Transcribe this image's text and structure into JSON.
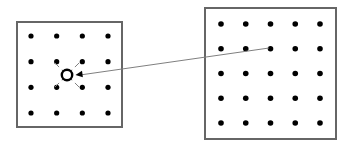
{
  "figure": {
    "background_color": "#ffffff",
    "width": 346,
    "height": 149,
    "panels": [
      {
        "id": "left-panel",
        "name": "coarse-lattice-panel",
        "border_color": "#666666",
        "border_width": 2,
        "fill_color": "#ffffff",
        "x": 17,
        "y": 22,
        "width": 105,
        "height": 105,
        "grid": {
          "rows": 4,
          "cols": 4,
          "dot_color": "#000000",
          "dot_radius": 2.6,
          "margin_x": 14,
          "margin_y": 14
        },
        "highlight": {
          "name": "center-ring-marker",
          "shape": "ring",
          "stroke_color": "#000000",
          "stroke_width": 2.4,
          "radius": 5.2,
          "cx": 67,
          "cy": 75
        },
        "arrows": {
          "name": "inward-diagonal-arrows",
          "count": 4,
          "color": "#808080",
          "head_color": "#707070",
          "directions": [
            "up-left",
            "up-right",
            "down-left",
            "down-right"
          ],
          "note": "four short diagonal arrows from nearest neighbour dots pointing toward the ring marker"
        }
      },
      {
        "id": "right-panel",
        "name": "fine-lattice-panel",
        "border_color": "#666666",
        "border_width": 2,
        "fill_color": "#ffffff",
        "x": 205,
        "y": 8,
        "width": 131,
        "height": 131,
        "grid": {
          "rows": 5,
          "cols": 5,
          "dot_color": "#000000",
          "dot_radius": 2.8,
          "margin_x": 16,
          "margin_y": 16
        }
      }
    ],
    "connector": {
      "name": "correspondence-connector-line",
      "color": "#808080",
      "width": 1,
      "has_arrowhead": true,
      "arrowhead_color": "#000000",
      "from_panel": "right-panel",
      "from_point": {
        "row": 2,
        "col": 3,
        "x": 269,
        "y": 48
      },
      "to_panel": "left-panel",
      "to_point": {
        "x": 74,
        "y": 75
      }
    }
  }
}
